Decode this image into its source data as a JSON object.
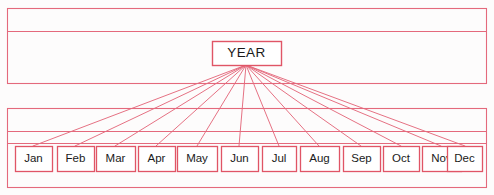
{
  "diagram": {
    "type": "hierarchy-tree",
    "title_fragment": "",
    "canvas": {
      "width": 494,
      "height": 195,
      "background": "#fdfcfc"
    },
    "colors": {
      "line": "#e4697c",
      "line_dark": "#d9485e",
      "box_border": "#e05566",
      "text": "#1a1a1a",
      "background": "#ffffff"
    },
    "root": {
      "label": "YEAR",
      "box": {
        "x": 212,
        "y": 41,
        "width": 69,
        "height": 24
      },
      "anchor": {
        "x": 246,
        "y": 65
      }
    },
    "children": [
      {
        "label": "Jan",
        "box": {
          "x": 15,
          "y": 146,
          "width": 37,
          "height": 25
        },
        "anchor": {
          "x": 33,
          "y": 146
        }
      },
      {
        "label": "Feb",
        "box": {
          "x": 57,
          "y": 146,
          "width": 37,
          "height": 25
        },
        "anchor": {
          "x": 75,
          "y": 146
        }
      },
      {
        "label": "Mar",
        "box": {
          "x": 96,
          "y": 146,
          "width": 39,
          "height": 25
        },
        "anchor": {
          "x": 115,
          "y": 146
        }
      },
      {
        "label": "Apr",
        "box": {
          "x": 138,
          "y": 146,
          "width": 37,
          "height": 25
        },
        "anchor": {
          "x": 156,
          "y": 146
        }
      },
      {
        "label": "May",
        "box": {
          "x": 177,
          "y": 146,
          "width": 40,
          "height": 25
        },
        "anchor": {
          "x": 197,
          "y": 146
        }
      },
      {
        "label": "Jun",
        "box": {
          "x": 221,
          "y": 146,
          "width": 37,
          "height": 25
        },
        "anchor": {
          "x": 239,
          "y": 146
        }
      },
      {
        "label": "Jul",
        "box": {
          "x": 262,
          "y": 146,
          "width": 34,
          "height": 25
        },
        "anchor": {
          "x": 279,
          "y": 146
        }
      },
      {
        "label": "Aug",
        "box": {
          "x": 300,
          "y": 146,
          "width": 39,
          "height": 25
        },
        "anchor": {
          "x": 319,
          "y": 146
        }
      },
      {
        "label": "Sep",
        "box": {
          "x": 343,
          "y": 146,
          "width": 37,
          "height": 25
        },
        "anchor": {
          "x": 361,
          "y": 146
        }
      },
      {
        "label": "Oct",
        "box": {
          "x": 383,
          "y": 146,
          "width": 36,
          "height": 25
        },
        "anchor": {
          "x": 401,
          "y": 146
        }
      },
      {
        "label": "Nov",
        "box": {
          "x": 422,
          "y": 146,
          "width": 39,
          "height": 25
        },
        "anchor": {
          "x": 441,
          "y": 146
        }
      },
      {
        "label": "Dec",
        "box": {
          "x": 447,
          "y": 146,
          "width": 35,
          "height": 25
        },
        "anchor": {
          "x": 465,
          "y": 146
        }
      }
    ],
    "frames": [
      {
        "name": "upper-frame",
        "x": 7,
        "y": 8,
        "width": 480,
        "height": 76,
        "divider_y": 31
      },
      {
        "name": "lower-frame",
        "x": 7,
        "y": 108,
        "width": 480,
        "height": 80,
        "divider_y": 131
      }
    ],
    "extra_rules": [
      {
        "name": "lower-inner-rule",
        "x1": 7,
        "y1": 143,
        "x2": 487,
        "y2": 143
      }
    ]
  }
}
